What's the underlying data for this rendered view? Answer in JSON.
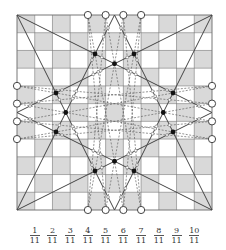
{
  "diagram": {
    "grid_size": 11,
    "board": {
      "x": 17,
      "y": 15,
      "size": 195
    },
    "colors": {
      "shade": "#d9d9d9",
      "light": "#ffffff",
      "grid_line": "#777777",
      "solid_line": "#444444",
      "dashed_line": "#666666",
      "dot_fill": "#111111",
      "circle_stroke": "#444444"
    },
    "shading": "checkerboard, (row+col) even shaded",
    "boundary_circles": {
      "top": [
        4,
        5,
        6,
        7
      ],
      "bottom": [
        4,
        5,
        6,
        7
      ],
      "left": [
        4,
        5,
        6,
        7
      ],
      "right": [
        4,
        5,
        6,
        7
      ]
    },
    "solid_lines": [
      [
        [
          0,
          0
        ],
        [
          11,
          5.5
        ]
      ],
      [
        [
          0,
          0
        ],
        [
          5.5,
          11
        ]
      ],
      [
        [
          11,
          0
        ],
        [
          0,
          5.5
        ]
      ],
      [
        [
          11,
          0
        ],
        [
          5.5,
          11
        ]
      ],
      [
        [
          0,
          11
        ],
        [
          5.5,
          0
        ]
      ],
      [
        [
          0,
          11
        ],
        [
          11,
          5.5
        ]
      ],
      [
        [
          11,
          11
        ],
        [
          0,
          5.5
        ]
      ],
      [
        [
          11,
          11
        ],
        [
          5.5,
          0
        ]
      ]
    ],
    "dashed_lines": [
      [
        [
          4,
          0
        ],
        [
          6,
          11
        ]
      ],
      [
        [
          5,
          0
        ],
        [
          7,
          11
        ]
      ],
      [
        [
          6,
          0
        ],
        [
          4,
          11
        ]
      ],
      [
        [
          7,
          0
        ],
        [
          5,
          11
        ]
      ],
      [
        [
          4,
          0
        ],
        [
          5,
          11
        ]
      ],
      [
        [
          7,
          0
        ],
        [
          6,
          11
        ]
      ],
      [
        [
          5,
          0
        ],
        [
          4,
          11
        ]
      ],
      [
        [
          6,
          0
        ],
        [
          7,
          11
        ]
      ],
      [
        [
          0,
          4
        ],
        [
          11,
          6
        ]
      ],
      [
        [
          0,
          5
        ],
        [
          11,
          7
        ]
      ],
      [
        [
          0,
          6
        ],
        [
          11,
          4
        ]
      ],
      [
        [
          0,
          7
        ],
        [
          11,
          5
        ]
      ],
      [
        [
          0,
          4
        ],
        [
          11,
          5
        ]
      ],
      [
        [
          0,
          7
        ],
        [
          11,
          6
        ]
      ],
      [
        [
          0,
          5
        ],
        [
          11,
          4
        ]
      ],
      [
        [
          0,
          6
        ],
        [
          11,
          7
        ]
      ]
    ],
    "filled_dots": [
      [
        4.4,
        2.2
      ],
      [
        5.5,
        2.75
      ],
      [
        6.6,
        2.2
      ],
      [
        2.2,
        4.4
      ],
      [
        2.75,
        5.5
      ],
      [
        2.2,
        6.6
      ],
      [
        8.8,
        4.4
      ],
      [
        8.25,
        5.5
      ],
      [
        8.8,
        6.6
      ],
      [
        4.4,
        8.8
      ],
      [
        5.5,
        8.25
      ],
      [
        6.6,
        8.8
      ]
    ],
    "x_axis_labels": [
      {
        "num": "1",
        "den": "11"
      },
      {
        "num": "2",
        "den": "11"
      },
      {
        "num": "3",
        "den": "11"
      },
      {
        "num": "4",
        "den": "11"
      },
      {
        "num": "5",
        "den": "11"
      },
      {
        "num": "6",
        "den": "11"
      },
      {
        "num": "7",
        "den": "11"
      },
      {
        "num": "8",
        "den": "11"
      },
      {
        "num": "9",
        "den": "11"
      },
      {
        "num": "10",
        "den": "11"
      }
    ]
  }
}
